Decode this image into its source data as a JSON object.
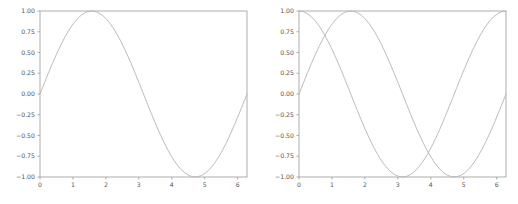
{
  "figure": {
    "background_color": "#ffffff",
    "line_color": "#b4b4b4",
    "spine_color": "#9a9a9a",
    "tick_label_color": "#555555",
    "panel_count": 2
  },
  "chart_data": [
    {
      "type": "line",
      "title": "",
      "xlabel": "",
      "ylabel": "",
      "xlim": [
        0,
        6.283185307179586
      ],
      "ylim": [
        -1.0,
        1.0
      ],
      "grid": false,
      "legend": null,
      "xticks": [
        0,
        1,
        2,
        3,
        4,
        5,
        6
      ],
      "xticklabels": [
        "0",
        "1",
        "2",
        "3",
        "4",
        "5",
        "6"
      ],
      "yticks": [
        -1.0,
        -0.75,
        -0.5,
        -0.25,
        0.0,
        0.25,
        0.5,
        0.75,
        1.0
      ],
      "yticklabels": [
        "−1.00",
        "−0.75",
        "−0.50",
        "−0.25",
        "0.00",
        "0.25",
        "0.50",
        "0.75",
        "1.00"
      ],
      "series": [
        {
          "name": "sin(x)",
          "color": "#b4b4b4",
          "x": [
            0.0,
            0.1257,
            0.2513,
            0.377,
            0.5027,
            0.6283,
            0.754,
            0.8796,
            1.0053,
            1.131,
            1.2566,
            1.3823,
            1.508,
            1.6336,
            1.7593,
            1.885,
            2.0106,
            2.1363,
            2.262,
            2.3876,
            2.5133,
            2.6389,
            2.7646,
            2.8903,
            3.0159,
            3.1416,
            3.2673,
            3.3929,
            3.5186,
            3.6442,
            3.7699,
            3.8956,
            4.0212,
            4.1469,
            4.2726,
            4.3982,
            4.5239,
            4.6496,
            4.7752,
            4.9009,
            5.0265,
            5.1522,
            5.2779,
            5.4035,
            5.5292,
            5.6549,
            5.7805,
            5.9062,
            6.0319,
            6.1575,
            6.2832
          ],
          "y": [
            0.0,
            0.1253,
            0.2487,
            0.3681,
            0.4818,
            0.5878,
            0.6845,
            0.7705,
            0.8443,
            0.9048,
            0.9511,
            0.9823,
            0.998,
            0.998,
            0.9823,
            0.9511,
            0.9048,
            0.8443,
            0.7705,
            0.6845,
            0.5878,
            0.4818,
            0.3681,
            0.2487,
            0.1253,
            0.0,
            -0.1253,
            -0.2487,
            -0.3681,
            -0.4818,
            -0.5878,
            -0.6845,
            -0.7705,
            -0.8443,
            -0.9048,
            -0.9511,
            -0.9823,
            -0.998,
            -0.998,
            -0.9823,
            -0.9511,
            -0.9048,
            -0.8443,
            -0.7705,
            -0.6845,
            -0.5878,
            -0.4818,
            -0.3681,
            -0.2487,
            -0.1253,
            0.0
          ]
        }
      ]
    },
    {
      "type": "line",
      "title": "",
      "xlabel": "",
      "ylabel": "",
      "xlim": [
        0,
        6.283185307179586
      ],
      "ylim": [
        -1.0,
        1.0
      ],
      "grid": false,
      "legend": null,
      "xticks": [
        0,
        1,
        2,
        3,
        4,
        5,
        6
      ],
      "xticklabels": [
        "0",
        "1",
        "2",
        "3",
        "4",
        "5",
        "6"
      ],
      "yticks": [
        -1.0,
        -0.75,
        -0.5,
        -0.25,
        0.0,
        0.25,
        0.5,
        0.75,
        1.0
      ],
      "yticklabels": [
        "−1.00",
        "−0.75",
        "−0.50",
        "−0.25",
        "0.00",
        "0.25",
        "0.50",
        "0.75",
        "1.00"
      ],
      "series": [
        {
          "name": "sin(x)",
          "color": "#b4b4b4",
          "x": [
            0.0,
            0.1257,
            0.2513,
            0.377,
            0.5027,
            0.6283,
            0.754,
            0.8796,
            1.0053,
            1.131,
            1.2566,
            1.3823,
            1.508,
            1.6336,
            1.7593,
            1.885,
            2.0106,
            2.1363,
            2.262,
            2.3876,
            2.5133,
            2.6389,
            2.7646,
            2.8903,
            3.0159,
            3.1416,
            3.2673,
            3.3929,
            3.5186,
            3.6442,
            3.7699,
            3.8956,
            4.0212,
            4.1469,
            4.2726,
            4.3982,
            4.5239,
            4.6496,
            4.7752,
            4.9009,
            5.0265,
            5.1522,
            5.2779,
            5.4035,
            5.5292,
            5.6549,
            5.7805,
            5.9062,
            6.0319,
            6.1575,
            6.2832
          ],
          "y": [
            0.0,
            0.1253,
            0.2487,
            0.3681,
            0.4818,
            0.5878,
            0.6845,
            0.7705,
            0.8443,
            0.9048,
            0.9511,
            0.9823,
            0.998,
            0.998,
            0.9823,
            0.9511,
            0.9048,
            0.8443,
            0.7705,
            0.6845,
            0.5878,
            0.4818,
            0.3681,
            0.2487,
            0.1253,
            0.0,
            -0.1253,
            -0.2487,
            -0.3681,
            -0.4818,
            -0.5878,
            -0.6845,
            -0.7705,
            -0.8443,
            -0.9048,
            -0.9511,
            -0.9823,
            -0.998,
            -0.998,
            -0.9823,
            -0.9511,
            -0.9048,
            -0.8443,
            -0.7705,
            -0.6845,
            -0.5878,
            -0.4818,
            -0.3681,
            -0.2487,
            -0.1253,
            0.0
          ]
        },
        {
          "name": "cos(x)",
          "color": "#b4b4b4",
          "x": [
            0.0,
            0.1257,
            0.2513,
            0.377,
            0.5027,
            0.6283,
            0.754,
            0.8796,
            1.0053,
            1.131,
            1.2566,
            1.3823,
            1.508,
            1.6336,
            1.7593,
            1.885,
            2.0106,
            2.1363,
            2.262,
            2.3876,
            2.5133,
            2.6389,
            2.7646,
            2.8903,
            3.0159,
            3.1416,
            3.2673,
            3.3929,
            3.5186,
            3.6442,
            3.7699,
            3.8956,
            4.0212,
            4.1469,
            4.2726,
            4.3982,
            4.5239,
            4.6496,
            4.7752,
            4.9009,
            5.0265,
            5.1522,
            5.2779,
            5.4035,
            5.5292,
            5.6549,
            5.7805,
            5.9062,
            6.0319,
            6.1575,
            6.2832
          ],
          "y": [
            1.0,
            0.9921,
            0.9686,
            0.9298,
            0.8763,
            0.809,
            0.729,
            0.6374,
            0.5358,
            0.4258,
            0.309,
            0.1874,
            0.0628,
            -0.0628,
            -0.1874,
            -0.309,
            -0.4258,
            -0.5358,
            -0.6374,
            -0.729,
            -0.809,
            -0.8763,
            -0.9298,
            -0.9686,
            -0.9921,
            -1.0,
            -0.9921,
            -0.9686,
            -0.9298,
            -0.8763,
            -0.809,
            -0.729,
            -0.6374,
            -0.5358,
            -0.4258,
            -0.309,
            -0.1874,
            -0.0628,
            0.0628,
            0.1874,
            0.309,
            0.4258,
            0.5358,
            0.6374,
            0.729,
            0.809,
            0.8763,
            0.9298,
            0.9686,
            0.9921,
            1.0
          ]
        }
      ]
    }
  ]
}
